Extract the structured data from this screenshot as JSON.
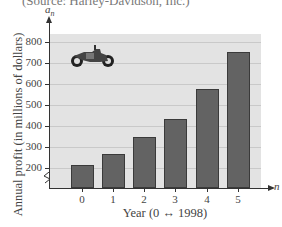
{
  "source_text": "(Source: Harley-Davidson, Inc.)",
  "chart_data": {
    "type": "bar",
    "title": "",
    "xlabel": "Year (0 ↔ 1998)",
    "ylabel": "Annual profit (in millions of dollars)",
    "y_axis_symbol": "a",
    "y_axis_subscript": "n",
    "x_axis_symbol": "n",
    "categories": [
      "0",
      "1",
      "2",
      "3",
      "4",
      "5"
    ],
    "values": [
      214,
      267,
      348,
      433,
      576,
      752
    ],
    "yticks": [
      200,
      300,
      400,
      500,
      600,
      700,
      800
    ],
    "ylim": [
      150,
      850
    ],
    "axis_break": true,
    "grid": true,
    "bar_color": "#636363",
    "background_color": "#e3e3e3",
    "decoration": "motorcycle-icon"
  }
}
